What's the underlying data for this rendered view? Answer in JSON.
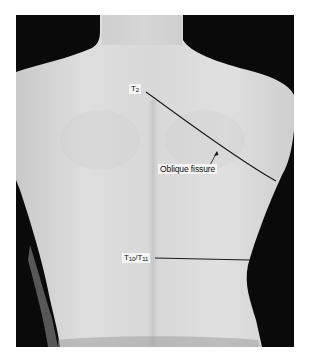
{
  "figure": {
    "labels": {
      "t2": {
        "main": "T",
        "sub": "2"
      },
      "oblique_fissure": "Oblique fissure",
      "t10_t11": {
        "a_main": "T",
        "a_sub": "10",
        "sep": "/",
        "b_main": "T",
        "b_sub": "11"
      }
    },
    "colors": {
      "skin": "#d9d9d9",
      "background": "#0a0a0a",
      "line": "#1a1a1a",
      "page": "#ffffff"
    }
  }
}
